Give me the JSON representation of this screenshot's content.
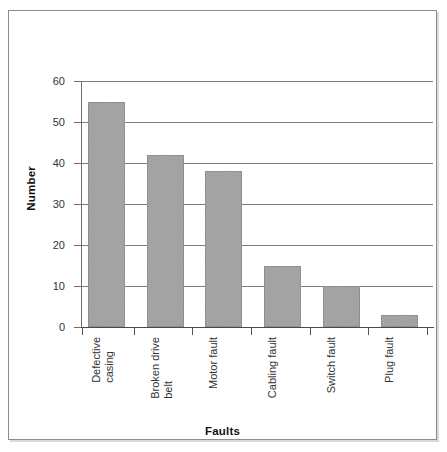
{
  "chart_data": {
    "type": "bar",
    "title": "",
    "xlabel": "Faults",
    "ylabel": "Number",
    "categories": [
      "Defective\ncasing",
      "Broken drive\nbelt",
      "Motor fault",
      "Cabling fault",
      "Switch fault",
      "Plug fault"
    ],
    "values": [
      55,
      42,
      38,
      15,
      10,
      3
    ],
    "ylim": [
      0,
      60
    ],
    "ytick_values": [
      0,
      10,
      20,
      30,
      40,
      50,
      60
    ],
    "ytick_labels": [
      "0",
      "10",
      "20",
      "30",
      "40",
      "50",
      "60"
    ],
    "grid": true,
    "grid_axis": "y",
    "legend": false,
    "bar_color": "#a9a9a9",
    "bar_edge_color": "#8f8f8f",
    "axis_color": "#4a4a4a",
    "frame_border_color": "#8d8d8d"
  }
}
